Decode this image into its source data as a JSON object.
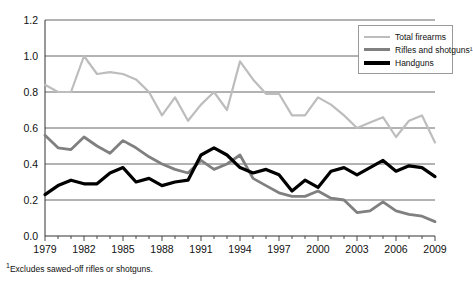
{
  "chart_data": {
    "type": "line",
    "title": "",
    "subtitle": "",
    "xlabel": "",
    "ylabel": "",
    "xlim": [
      1979,
      2009
    ],
    "ylim": [
      0.0,
      1.2
    ],
    "ytick_labels": [
      "0.0",
      "0.2",
      "0.4",
      "0.6",
      "0.8",
      "1.0",
      "1.2"
    ],
    "ytick_values": [
      0.0,
      0.2,
      0.4,
      0.6,
      0.8,
      1.0,
      1.2
    ],
    "xtick_labels": [
      "1979",
      "1982",
      "1985",
      "1988",
      "1991",
      "1994",
      "1997",
      "2000",
      "2003",
      "2006",
      "2009"
    ],
    "xtick_values": [
      1979,
      1982,
      1985,
      1988,
      1991,
      1994,
      1997,
      2000,
      2003,
      2006,
      2009
    ],
    "x": [
      1979,
      1980,
      1981,
      1982,
      1983,
      1984,
      1985,
      1986,
      1987,
      1988,
      1989,
      1990,
      1991,
      1992,
      1993,
      1994,
      1995,
      1996,
      1997,
      1998,
      1999,
      2000,
      2001,
      2002,
      2003,
      2004,
      2005,
      2006,
      2007,
      2008,
      2009
    ],
    "grid": true,
    "grid_axis": "y",
    "legend_position": "top-right",
    "series": [
      {
        "name": "Total firearms",
        "color": "#bdbdbd",
        "width": 2.2,
        "values": [
          0.84,
          0.8,
          0.8,
          1.0,
          0.9,
          0.91,
          0.9,
          0.87,
          0.8,
          0.67,
          0.77,
          0.64,
          0.73,
          0.8,
          0.7,
          0.97,
          0.87,
          0.79,
          0.79,
          0.67,
          0.67,
          0.77,
          0.73,
          0.67,
          0.6,
          0.63,
          0.66,
          0.55,
          0.64,
          0.67,
          0.52
        ]
      },
      {
        "name": "Rifles and shotguns¹",
        "color": "#808080",
        "width": 2.8,
        "values": [
          0.56,
          0.49,
          0.48,
          0.55,
          0.5,
          0.46,
          0.53,
          0.49,
          0.44,
          0.4,
          0.37,
          0.35,
          0.42,
          0.37,
          0.4,
          0.45,
          0.32,
          0.28,
          0.24,
          0.22,
          0.22,
          0.25,
          0.21,
          0.2,
          0.13,
          0.14,
          0.19,
          0.14,
          0.12,
          0.11,
          0.08
        ]
      },
      {
        "name": "Handguns",
        "color": "#000000",
        "width": 3.2,
        "values": [
          0.23,
          0.28,
          0.31,
          0.29,
          0.29,
          0.35,
          0.38,
          0.3,
          0.32,
          0.28,
          0.3,
          0.31,
          0.45,
          0.49,
          0.45,
          0.38,
          0.35,
          0.37,
          0.34,
          0.25,
          0.31,
          0.27,
          0.36,
          0.38,
          0.34,
          0.38,
          0.42,
          0.36,
          0.39,
          0.38,
          0.33
        ]
      }
    ],
    "footnote": "Excludes sawed-off rifles or shotguns.",
    "footnote_marker": "1"
  },
  "legend": {
    "items": [
      {
        "label": "Total firearms"
      },
      {
        "label": "Rifles and shotguns¹"
      },
      {
        "label": "Handguns"
      }
    ]
  }
}
